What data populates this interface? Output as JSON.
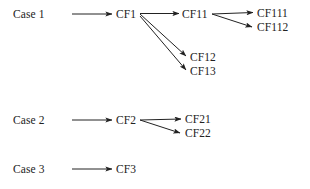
{
  "diagram": {
    "type": "directed-graph",
    "title": "",
    "background_color": "#ffffff",
    "stroke_color": "#222222",
    "text_color": "#222222",
    "rows": [
      {
        "case_label": "Case 1",
        "nodes": [
          {
            "id": "CF1",
            "label": "CF1"
          },
          {
            "id": "CF11",
            "label": "CF11"
          },
          {
            "id": "CF12",
            "label": "CF12"
          },
          {
            "id": "CF13",
            "label": "CF13"
          },
          {
            "id": "CF111",
            "label": "CF111"
          },
          {
            "id": "CF112",
            "label": "CF112"
          }
        ],
        "edges": [
          {
            "from": "Case 1",
            "to": "CF1"
          },
          {
            "from": "CF1",
            "to": "CF11"
          },
          {
            "from": "CF1",
            "to": "CF12"
          },
          {
            "from": "CF1",
            "to": "CF13"
          },
          {
            "from": "CF11",
            "to": "CF111"
          },
          {
            "from": "CF11",
            "to": "CF112"
          }
        ]
      },
      {
        "case_label": "Case 2",
        "nodes": [
          {
            "id": "CF2",
            "label": "CF2"
          },
          {
            "id": "CF21",
            "label": "CF21"
          },
          {
            "id": "CF22",
            "label": "CF22"
          }
        ],
        "edges": [
          {
            "from": "Case 2",
            "to": "CF2"
          },
          {
            "from": "CF2",
            "to": "CF21"
          },
          {
            "from": "CF2",
            "to": "CF22"
          }
        ]
      },
      {
        "case_label": "Case 3",
        "nodes": [
          {
            "id": "CF3",
            "label": "CF3"
          }
        ],
        "edges": [
          {
            "from": "Case 3",
            "to": "CF3"
          }
        ]
      }
    ],
    "labels": {
      "case1": "Case 1",
      "case2": "Case 2",
      "case3": "Case 3",
      "cf1": "CF1",
      "cf11": "CF11",
      "cf12": "CF12",
      "cf13": "CF13",
      "cf111": "CF111",
      "cf112": "CF112",
      "cf2": "CF2",
      "cf21": "CF21",
      "cf22": "CF22",
      "cf3": "CF3"
    }
  }
}
